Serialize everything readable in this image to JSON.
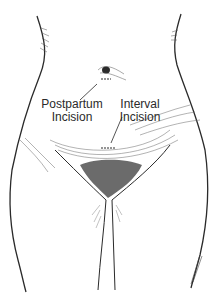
{
  "figure": {
    "labels": {
      "postpartum_line1": "Postpartum",
      "postpartum_line2": "Incision",
      "interval_line1": "Interval",
      "interval_line2": "Incision"
    },
    "signature": "illustrator signature",
    "colors": {
      "ink": "#2a2a2a",
      "background": "#ffffff"
    }
  }
}
